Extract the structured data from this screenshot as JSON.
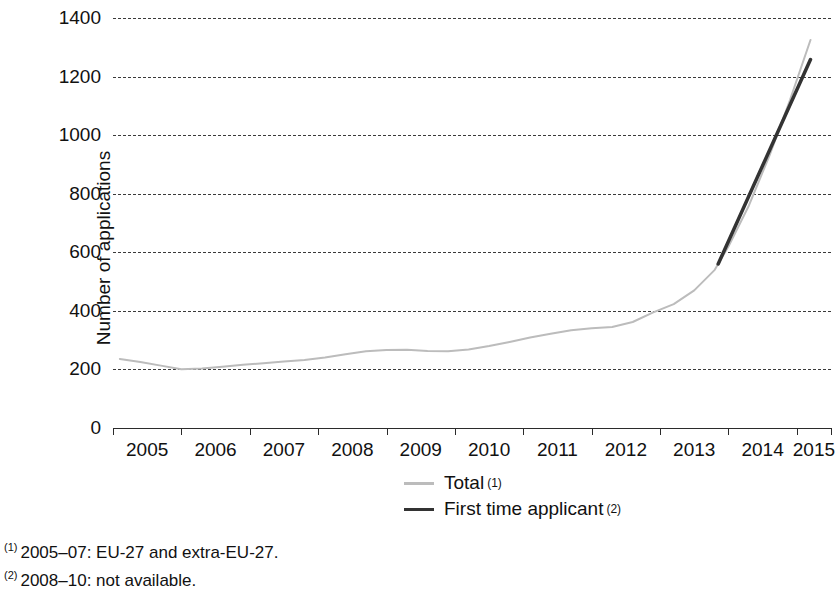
{
  "chart_data": {
    "type": "line",
    "title": "",
    "xlabel": "",
    "ylabel": "Number of applications",
    "xlim": [
      2005,
      2015.5
    ],
    "ylim": [
      0,
      1400
    ],
    "yticks": [
      0,
      200,
      400,
      600,
      800,
      1000,
      1200,
      1400
    ],
    "ytick_labels": [
      "0",
      "200",
      "400",
      "600",
      "800",
      "1000",
      "1200",
      "1400"
    ],
    "xticks": [
      2005,
      2006,
      2007,
      2008,
      2009,
      2010,
      2011,
      2012,
      2013,
      2014,
      2015
    ],
    "xtick_labels": [
      "2005",
      "2006",
      "2007",
      "2008",
      "2009",
      "2010",
      "2011",
      "2012",
      "2013",
      "2014",
      "2015"
    ],
    "grid": "horizontal-dashed",
    "legend_position": "bottom-center",
    "series": [
      {
        "name": "Total",
        "footnote_ref": "(1)",
        "color": "#bcbcbc",
        "width": 2.0,
        "x": [
          2005.1,
          2005.4,
          2005.7,
          2006.0,
          2006.3,
          2006.6,
          2006.9,
          2007.2,
          2007.5,
          2007.8,
          2008.1,
          2008.4,
          2008.7,
          2009.0,
          2009.3,
          2009.6,
          2009.9,
          2010.2,
          2010.5,
          2010.8,
          2011.1,
          2011.4,
          2011.7,
          2012.0,
          2012.3,
          2012.6,
          2012.9,
          2013.2,
          2013.5,
          2013.8,
          2014.0,
          2014.3,
          2014.6,
          2014.9,
          2015.2
        ],
        "y": [
          236,
          225,
          213,
          201,
          203,
          209,
          216,
          221,
          227,
          232,
          241,
          252,
          262,
          266,
          267,
          263,
          262,
          268,
          280,
          294,
          309,
          322,
          334,
          341,
          345,
          362,
          395,
          423,
          470,
          540,
          620,
          760,
          930,
          1120,
          1325
        ]
      },
      {
        "name": "First time applicant",
        "footnote_ref": "(2)",
        "color": "#333333",
        "width": 3.5,
        "x": [
          2013.85,
          2015.2
        ],
        "y": [
          560,
          1258
        ]
      }
    ]
  },
  "legend": {
    "items": [
      {
        "label": "Total",
        "footnote": "(1)",
        "style": "total"
      },
      {
        "label": "First time applicant",
        "footnote": "(2)",
        "style": "first-time"
      }
    ]
  },
  "footnotes": [
    {
      "marker": "(1)",
      "text": "2005–07: EU-27 and extra-EU-27."
    },
    {
      "marker": "(2)",
      "text": "2008–10: not available."
    }
  ]
}
